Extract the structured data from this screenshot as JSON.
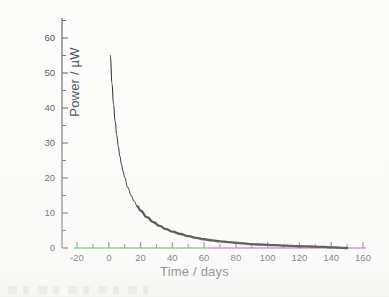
{
  "figure": {
    "background_color": "#fcfcfb",
    "axis_label_color": "#3a3a52",
    "tick_label_color": "#4a4a5e",
    "curve_color": "#1a1a1a",
    "zero_line_color": "#8a8a8a",
    "xaxis_segment_colors": {
      "left": "#7ddb7d",
      "right": "#d98fd0"
    },
    "xaxis_segment_split_days": 62
  },
  "axis_titles": {
    "y": "Power / µW",
    "x": "Time / days"
  },
  "chart_data": {
    "type": "line",
    "title": "",
    "subtitle": "",
    "xlabel": "Time / days",
    "ylabel": "Power / µW",
    "xlim": [
      -25,
      163
    ],
    "ylim": [
      -6,
      66
    ],
    "grid": false,
    "legend": "none",
    "x_ticks": [
      -20,
      0,
      20,
      40,
      60,
      80,
      100,
      120,
      140,
      160
    ],
    "x_tick_labels": [
      "-20",
      "0",
      "20",
      "40",
      "60",
      "80",
      "100",
      "120",
      "140",
      "160"
    ],
    "x_minor_ticks": [
      -10,
      10,
      30,
      50,
      70,
      90,
      110,
      130,
      150
    ],
    "y_ticks": [
      0,
      10,
      20,
      30,
      40,
      50,
      60
    ],
    "y_tick_labels": [
      "0",
      "10",
      "20",
      "30",
      "40",
      "50",
      "60"
    ],
    "y_minor_ticks": [
      5,
      15,
      25,
      35,
      45,
      55,
      65
    ],
    "annotations": [
      {
        "name": "zero-reference-line",
        "type": "dotted-horizontal",
        "y": 0,
        "x_from": 5,
        "x_to": 155
      }
    ],
    "series": [
      {
        "name": "Power decay",
        "style": "solid-line-with-dense-markers",
        "x": [
          1,
          2,
          3,
          4,
          5,
          6,
          7,
          8,
          9,
          10,
          12,
          14,
          16,
          18,
          20,
          24,
          28,
          32,
          36,
          40,
          45,
          50,
          55,
          60,
          65,
          70,
          75,
          80,
          85,
          90,
          95,
          100,
          105,
          110,
          115,
          120,
          125,
          130,
          135,
          140,
          145,
          150
        ],
        "values": [
          55.0,
          47.0,
          41.0,
          36.2,
          32.3,
          29.0,
          26.2,
          23.9,
          21.9,
          20.1,
          17.3,
          15.1,
          13.3,
          11.9,
          10.7,
          8.8,
          7.4,
          6.3,
          5.4,
          4.7,
          4.0,
          3.4,
          2.9,
          2.5,
          2.2,
          1.9,
          1.7,
          1.5,
          1.3,
          1.1,
          1.0,
          0.9,
          0.8,
          0.7,
          0.6,
          0.5,
          0.45,
          0.4,
          0.3,
          0.2,
          0.1,
          0.0
        ]
      }
    ]
  }
}
